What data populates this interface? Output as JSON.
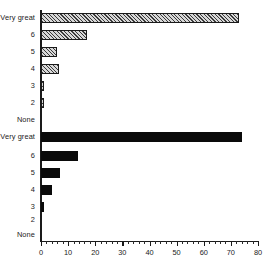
{
  "chart_data": {
    "type": "bar",
    "title": "",
    "subtitle": "",
    "xlabel": "",
    "ylabel": "",
    "orientation": "horizontal",
    "grid": false,
    "legend": "none",
    "xlim": [
      0,
      80
    ],
    "xticks": [
      0,
      10,
      20,
      30,
      40,
      50,
      60,
      70,
      80
    ],
    "xtick_labels": [
      "0",
      "10",
      "20",
      "30",
      "40",
      "50",
      "60",
      "70",
      "80"
    ],
    "minor_tick_interval": 2,
    "categories": [
      "Very great",
      "6",
      "5",
      "4",
      "3",
      "2",
      "None"
    ],
    "panels": [
      {
        "name": "top-panel",
        "fill": "hatched",
        "fill_color": "#d8d8d8",
        "edge_color": "#1a1a1a",
        "values": [
          73,
          17,
          6,
          6.5,
          1,
          1,
          0
        ]
      },
      {
        "name": "bottom-panel",
        "fill": "solid",
        "fill_color": "#0a0a0a",
        "edge_color": "#0a0a0a",
        "values": [
          74,
          13.5,
          7,
          4,
          1,
          0,
          0
        ]
      }
    ]
  },
  "axis": {
    "spine_color": "#1a1a1a",
    "baseline_color": "#1a1a1a"
  }
}
